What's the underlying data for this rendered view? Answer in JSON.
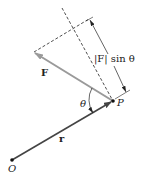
{
  "diagram": {
    "labels": {
      "force": "F",
      "position": "r",
      "angle": "θ",
      "point": "P",
      "origin": "O",
      "perpendicular_component": "|F| sin θ"
    },
    "points": {
      "O": [
        12,
        160
      ],
      "P": [
        113,
        101
      ],
      "F_tip": [
        34,
        52
      ],
      "dash_ext_top": [
        62,
        8
      ],
      "perp_foot": [
        89,
        19
      ]
    },
    "colors": {
      "r_vector": "#444444",
      "f_vector": "#9a9a9a",
      "lines": "#222222",
      "background": "#ffffff"
    }
  }
}
